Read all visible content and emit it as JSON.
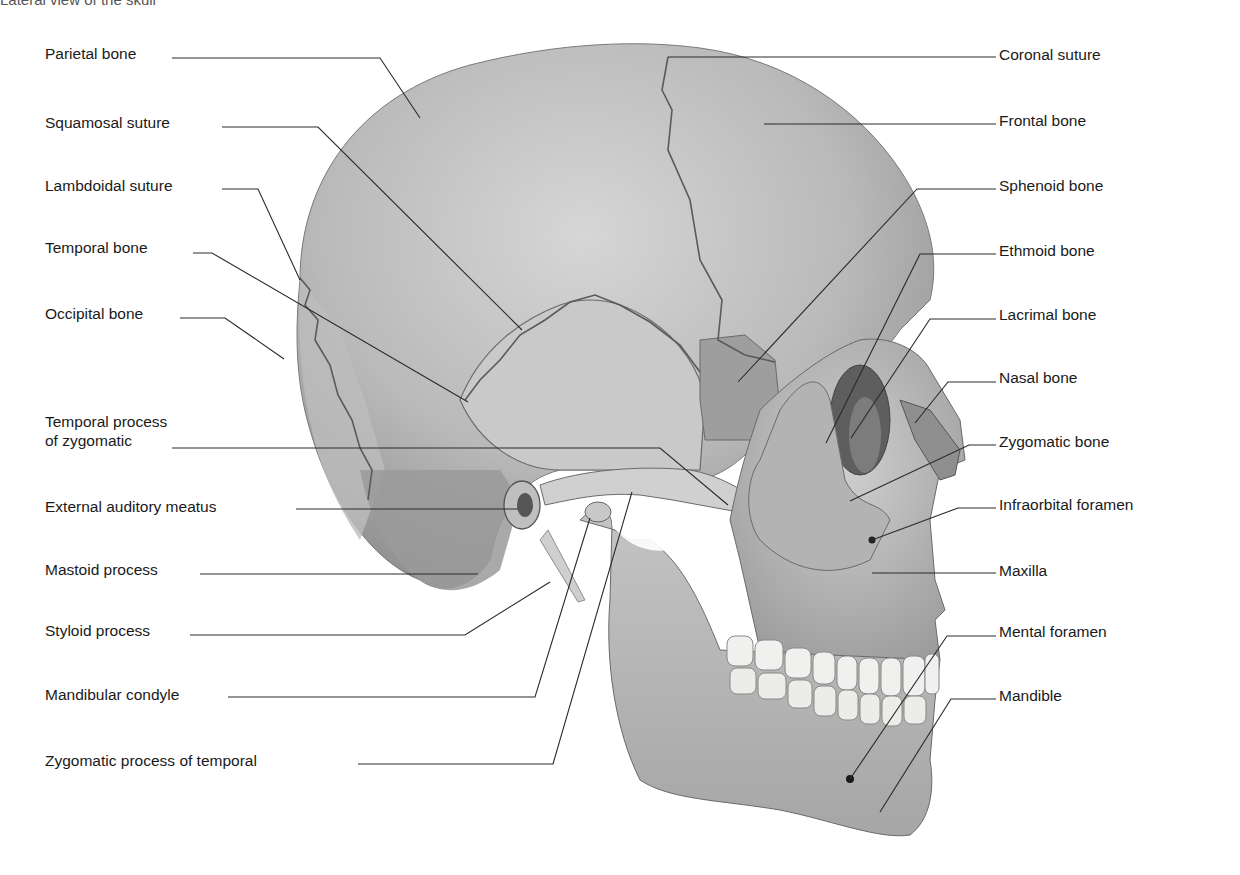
{
  "figure": {
    "caption_partial": "Lateral view of the skull"
  },
  "labels_left": [
    {
      "id": "parietal-bone",
      "text": "Parietal bone",
      "x": 45,
      "y": 44,
      "leader": [
        [
          172,
          58
        ],
        [
          380,
          58
        ],
        [
          420,
          118
        ]
      ]
    },
    {
      "id": "squamosal-suture",
      "text": "Squamosal suture",
      "x": 45,
      "y": 113,
      "leader": [
        [
          222,
          127
        ],
        [
          318,
          127
        ],
        [
          522,
          330
        ]
      ]
    },
    {
      "id": "lambdoidal-suture",
      "text": "Lambdoidal suture",
      "x": 45,
      "y": 176,
      "leader": [
        [
          222,
          189
        ],
        [
          258,
          189
        ],
        [
          300,
          280
        ]
      ]
    },
    {
      "id": "temporal-bone",
      "text": "Temporal bone",
      "x": 45,
      "y": 238,
      "leader": [
        [
          193,
          253
        ],
        [
          212,
          253
        ],
        [
          468,
          402
        ]
      ]
    },
    {
      "id": "occipital-bone",
      "text": "Occipital bone",
      "x": 45,
      "y": 304,
      "leader": [
        [
          180,
          318
        ],
        [
          225,
          318
        ],
        [
          284,
          359
        ]
      ]
    },
    {
      "id": "temporal-process-of-zygomatic",
      "text": "Temporal process",
      "text2": "of zygomatic",
      "x": 45,
      "y": 412,
      "leader": [
        [
          172,
          448
        ],
        [
          660,
          448
        ],
        [
          728,
          505
        ]
      ]
    },
    {
      "id": "external-auditory-meatus",
      "text": "External auditory meatus",
      "x": 45,
      "y": 497,
      "leader": [
        [
          296,
          509
        ],
        [
          518,
          509
        ]
      ]
    },
    {
      "id": "mastoid-process",
      "text": "Mastoid process",
      "x": 45,
      "y": 560,
      "leader": [
        [
          200,
          574
        ],
        [
          478,
          574
        ]
      ]
    },
    {
      "id": "styloid-process",
      "text": "Styloid process",
      "x": 45,
      "y": 621,
      "leader": [
        [
          190,
          635
        ],
        [
          465,
          635
        ],
        [
          550,
          582
        ]
      ]
    },
    {
      "id": "mandibular-condyle",
      "text": "Mandibular condyle",
      "x": 45,
      "y": 685,
      "leader": [
        [
          228,
          697
        ],
        [
          535,
          697
        ],
        [
          590,
          518
        ]
      ]
    },
    {
      "id": "zygomatic-process-of-temporal",
      "text": "Zygomatic process of temporal",
      "x": 45,
      "y": 751,
      "leader": [
        [
          358,
          764
        ],
        [
          553,
          764
        ],
        [
          632,
          492
        ]
      ]
    }
  ],
  "labels_right": [
    {
      "id": "coronal-suture",
      "text": "Coronal suture",
      "x": 999,
      "y": 45,
      "leader": [
        [
          996,
          57
        ],
        [
          668,
          57
        ]
      ]
    },
    {
      "id": "frontal-bone",
      "text": "Frontal bone",
      "x": 999,
      "y": 111,
      "leader": [
        [
          996,
          124
        ],
        [
          764,
          124
        ]
      ]
    },
    {
      "id": "sphenoid-bone",
      "text": "Sphenoid bone",
      "x": 999,
      "y": 176,
      "leader": [
        [
          996,
          189
        ],
        [
          917,
          189
        ],
        [
          738,
          382
        ]
      ]
    },
    {
      "id": "ethmoid-bone",
      "text": "Ethmoid bone",
      "x": 999,
      "y": 241,
      "leader": [
        [
          996,
          254
        ],
        [
          920,
          254
        ],
        [
          826,
          443
        ]
      ]
    },
    {
      "id": "lacrimal-bone",
      "text": "Lacrimal bone",
      "x": 999,
      "y": 305,
      "leader": [
        [
          996,
          319
        ],
        [
          930,
          319
        ],
        [
          851,
          438
        ]
      ]
    },
    {
      "id": "nasal-bone",
      "text": "Nasal bone",
      "x": 999,
      "y": 368,
      "leader": [
        [
          996,
          382
        ],
        [
          948,
          382
        ],
        [
          915,
          423
        ]
      ]
    },
    {
      "id": "zygomatic-bone",
      "text": "Zygomatic bone",
      "x": 999,
      "y": 432,
      "leader": [
        [
          996,
          445
        ],
        [
          969,
          445
        ],
        [
          850,
          501
        ]
      ]
    },
    {
      "id": "infraorbital-foramen",
      "text": "Infraorbital foramen",
      "x": 999,
      "y": 495,
      "leader": [
        [
          996,
          508
        ],
        [
          958,
          508
        ],
        [
          872,
          540
        ]
      ]
    },
    {
      "id": "maxilla",
      "text": "Maxilla",
      "x": 999,
      "y": 561,
      "leader": [
        [
          996,
          573
        ],
        [
          872,
          573
        ]
      ]
    },
    {
      "id": "mental-foramen",
      "text": "Mental foramen",
      "x": 999,
      "y": 622,
      "leader": [
        [
          996,
          636
        ],
        [
          947,
          636
        ],
        [
          850,
          779
        ]
      ]
    },
    {
      "id": "mandible",
      "text": "Mandible",
      "x": 999,
      "y": 686,
      "leader": [
        [
          996,
          699
        ],
        [
          951,
          699
        ],
        [
          880,
          812
        ]
      ]
    }
  ],
  "colors": {
    "bone_light": "#d9d9d9",
    "bone_mid": "#b8b8b8",
    "bone_dark": "#8c8c8c",
    "bone_shadow": "#6e6e6e",
    "teeth": "#f0f0ee",
    "line": "#2a2a2a",
    "text": "#1a1a1a"
  }
}
